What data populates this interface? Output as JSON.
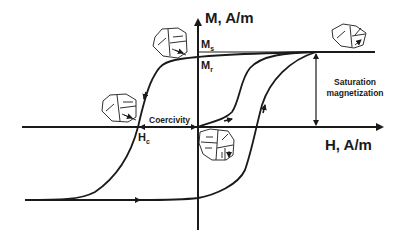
{
  "diagram": {
    "type": "magnetic hysteresis loop",
    "y_axis_label": "M, A/m",
    "x_axis_label": "H, A/m",
    "labels": {
      "ms_main": "M",
      "ms_sub": "s",
      "mr_main": "M",
      "mr_sub": "r",
      "hc_main": "H",
      "hc_sub": "c",
      "coercivity": "Coercivity",
      "saturation_line1": "Saturation",
      "saturation_line2": "magnetization"
    },
    "domain_illustrations": [
      {
        "position": "upper-left saturation",
        "state": "aligned"
      },
      {
        "position": "left near coercivity",
        "state": "mostly aligned"
      },
      {
        "position": "origin",
        "state": "random"
      },
      {
        "position": "upper-right saturation",
        "state": "aligned"
      }
    ],
    "colors": {
      "line": "#1a1a1a",
      "background": "#ffffff"
    }
  }
}
